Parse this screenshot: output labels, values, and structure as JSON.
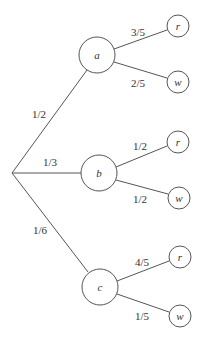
{
  "diagram": {
    "type": "probability-tree",
    "root": {
      "x": 12,
      "y": 173
    },
    "first_level": [
      {
        "id": "a",
        "label": "a",
        "prob": "1/2",
        "x": 97,
        "y": 55,
        "children": [
          {
            "id": "a-r",
            "label": "r",
            "prob": "3/5",
            "x": 178,
            "y": 26
          },
          {
            "id": "a-w",
            "label": "w",
            "prob": "2/5",
            "x": 178,
            "y": 82
          }
        ]
      },
      {
        "id": "b",
        "label": "b",
        "prob": "1/3",
        "x": 99,
        "y": 173,
        "children": [
          {
            "id": "b-r",
            "label": "r",
            "prob": "1/2",
            "x": 178,
            "y": 142
          },
          {
            "id": "b-w",
            "label": "w",
            "prob": "1/2",
            "x": 179,
            "y": 198
          }
        ]
      },
      {
        "id": "c",
        "label": "c",
        "prob": "1/6",
        "x": 100,
        "y": 287,
        "children": [
          {
            "id": "c-r",
            "label": "r",
            "prob": "4/5",
            "x": 180,
            "y": 257
          },
          {
            "id": "c-w",
            "label": "w",
            "prob": "1/5",
            "x": 180,
            "y": 316
          }
        ]
      }
    ]
  }
}
